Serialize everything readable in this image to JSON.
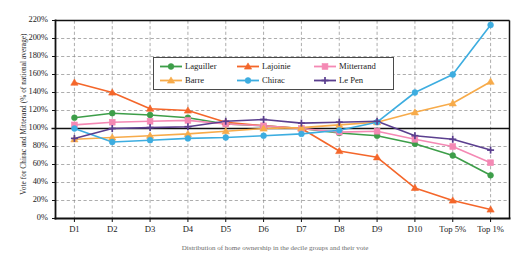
{
  "axes": {
    "ylabel": "Vote for Chirac and Mitterand (% of national average)",
    "yticks": [
      "0%",
      "20%",
      "40%",
      "60%",
      "80%",
      "100%",
      "120%",
      "140%",
      "160%",
      "180%",
      "200%",
      "220%"
    ],
    "xticks": [
      "D1",
      "D2",
      "D3",
      "D4",
      "D5",
      "D6",
      "D7",
      "D8",
      "D9",
      "D10",
      "Top 5%",
      "Top 1%"
    ]
  },
  "legend": [
    {
      "label": "Laguiller",
      "color": "#3d9e49",
      "marker": "circle"
    },
    {
      "label": "Lajoinie",
      "color": "#f4662a",
      "marker": "triangle"
    },
    {
      "label": "Mitterrand",
      "color": "#f489b4",
      "marker": "square"
    },
    {
      "label": "Barre",
      "color": "#f7ab4a",
      "marker": "triangle"
    },
    {
      "label": "Chirac",
      "color": "#3dade0",
      "marker": "circle"
    },
    {
      "label": "Le Pen",
      "color": "#5b3f8f",
      "marker": "plus"
    }
  ],
  "caption": "Distribution of home ownership in the decile groups and their vote",
  "chart_data": {
    "type": "line",
    "title": "",
    "xlabel": "",
    "ylabel": "Vote for Chirac and Mitterand (% of national average)",
    "categories": [
      "D1",
      "D2",
      "D3",
      "D4",
      "D5",
      "D6",
      "D7",
      "D8",
      "D9",
      "D10",
      "Top 5%",
      "Top 1%"
    ],
    "ylim": [
      0,
      220
    ],
    "ytick_step": 20,
    "grid": true,
    "reference_line": 100,
    "legend_position": "upper-center",
    "series": [
      {
        "name": "Laguiller",
        "color": "#3d9e49",
        "marker": "circle",
        "values": [
          112,
          117,
          115,
          112,
          105,
          103,
          100,
          95,
          92,
          83,
          70,
          48
        ]
      },
      {
        "name": "Lajoinie",
        "color": "#f4662a",
        "marker": "triangle",
        "values": [
          151,
          140,
          122,
          120,
          107,
          103,
          100,
          75,
          68,
          34,
          20,
          10
        ]
      },
      {
        "name": "Mitterrand",
        "color": "#f489b4",
        "marker": "square",
        "values": [
          104,
          107,
          108,
          109,
          105,
          103,
          100,
          96,
          97,
          88,
          80,
          62
        ]
      },
      {
        "name": "Barre",
        "color": "#f7ab4a",
        "marker": "triangle",
        "values": [
          88,
          90,
          92,
          94,
          97,
          100,
          101,
          104,
          107,
          118,
          128,
          152
        ]
      },
      {
        "name": "Chirac",
        "color": "#3dade0",
        "marker": "circle",
        "values": [
          100,
          85,
          87,
          89,
          90,
          92,
          94,
          98,
          107,
          140,
          160,
          215
        ]
      },
      {
        "name": "Le Pen",
        "color": "#5b3f8f",
        "marker": "plus",
        "values": [
          89,
          100,
          101,
          102,
          108,
          110,
          106,
          107,
          108,
          92,
          88,
          76
        ]
      }
    ]
  }
}
